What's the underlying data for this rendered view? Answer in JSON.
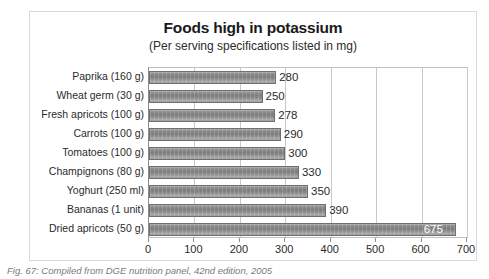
{
  "caption": "Fig. 67: Compiled from DGE nutrition panel, 42nd edition, 2005",
  "chart_data": {
    "type": "bar",
    "orientation": "horizontal",
    "title": "Foods high in potassium",
    "subtitle": "(Per serving specifications listed in mg)",
    "xlabel": "",
    "ylabel": "",
    "xlim": [
      0,
      700
    ],
    "xticks": [
      0,
      100,
      200,
      300,
      400,
      500,
      600,
      700
    ],
    "xtick_labels": [
      "0",
      "100",
      "200",
      "300",
      "400",
      "500",
      "600",
      "700"
    ],
    "grid": true,
    "legend": false,
    "bar_color": "#8a8a8a",
    "categories": [
      "Paprika (160 g)",
      "Wheat germ (30 g)",
      "Fresh apricots (100 g)",
      "Carrots (100 g)",
      "Tomatoes (100 g)",
      "Champignons (80 g)",
      "Yoghurt (250 ml)",
      "Bananas (1 unit)",
      "Dried apricots (50 g)"
    ],
    "values": [
      280,
      250,
      278,
      290,
      300,
      330,
      350,
      390,
      675
    ],
    "value_labels": [
      "280",
      "250",
      "278",
      "290",
      "300",
      "330",
      "350",
      "390",
      "675"
    ]
  }
}
